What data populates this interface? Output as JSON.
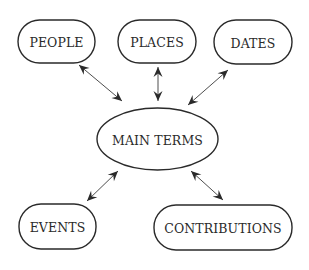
{
  "diagram": {
    "type": "concept-map",
    "center": {
      "id": "main",
      "label": "MAIN TERMS",
      "shape": "ellipse",
      "cx": 157.5,
      "cy": 139,
      "rx": 60.5,
      "ry": 31
    },
    "nodes": [
      {
        "id": "people",
        "label": "PEOPLE",
        "shape": "rounded-rect",
        "x": 18,
        "y": 20,
        "w": 77,
        "h": 43
      },
      {
        "id": "places",
        "label": "PLACES",
        "shape": "rounded-rect",
        "x": 118,
        "y": 20,
        "w": 78,
        "h": 43
      },
      {
        "id": "dates",
        "label": "DATES",
        "shape": "rounded-rect",
        "x": 214,
        "y": 20,
        "w": 78,
        "h": 44
      },
      {
        "id": "events",
        "label": "EVENTS",
        "shape": "rounded-rect",
        "x": 19,
        "y": 204,
        "w": 77,
        "h": 45
      },
      {
        "id": "contributions",
        "label": "CONTRIBUTIONS",
        "shape": "rounded-rect",
        "x": 154,
        "y": 205,
        "w": 138,
        "h": 45
      }
    ],
    "edges": [
      {
        "from": "people",
        "to": "main",
        "direction": "bidirectional",
        "x1": 79,
        "y1": 65,
        "x2": 122,
        "y2": 101
      },
      {
        "from": "places",
        "to": "main",
        "direction": "bidirectional",
        "x1": 158,
        "y1": 67,
        "x2": 158,
        "y2": 101
      },
      {
        "from": "dates",
        "to": "main",
        "direction": "bidirectional",
        "x1": 228,
        "y1": 70,
        "x2": 188,
        "y2": 105
      },
      {
        "from": "events",
        "to": "main",
        "direction": "bidirectional",
        "x1": 87,
        "y1": 201,
        "x2": 118,
        "y2": 171
      },
      {
        "from": "contributions",
        "to": "main",
        "direction": "bidirectional",
        "x1": 223,
        "y1": 200,
        "x2": 191,
        "y2": 171
      }
    ],
    "colors": {
      "stroke": "#2a2a2a",
      "background": "#ffffff",
      "text": "#2a2a2a"
    }
  }
}
